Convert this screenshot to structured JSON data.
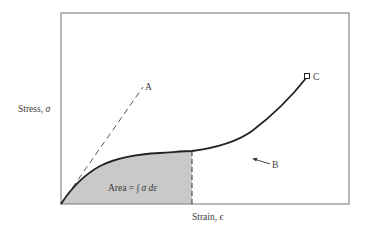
{
  "diagram": {
    "type": "stress-strain curve",
    "axes": {
      "ylabel_text": "Stress, ",
      "ylabel_symbol": "σ",
      "xlabel_text": "Strain, ",
      "xlabel_symbol": "ϵ"
    },
    "annotations": {
      "point_a": "A",
      "point_b": "B",
      "point_c": "C",
      "area_label_prefix": "Area = ",
      "area_label_integral": "∫ σ dε"
    },
    "elements": [
      {
        "name": "linear-elastic-dashed-line",
        "label": "A",
        "style": "dashed"
      },
      {
        "name": "stress-strain-curve",
        "style": "solid"
      },
      {
        "name": "curve-point-b",
        "label": "B",
        "marker": "arrow"
      },
      {
        "name": "curve-endpoint-c",
        "label": "C",
        "marker": "square"
      },
      {
        "name": "shaded-area",
        "label": "Area = ∫ σ dε",
        "fill": "#c8c8c8"
      },
      {
        "name": "strain-limit-dashed-line",
        "style": "dashed"
      }
    ],
    "colors": {
      "frame": "#8a8a8a",
      "curve": "#222222",
      "shade": "#c9c9c9",
      "dash": "#555555",
      "text": "#3a3a3a"
    }
  }
}
